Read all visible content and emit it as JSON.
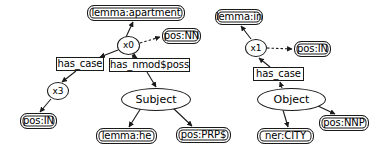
{
  "diagram": {
    "background_color": "#ffffff",
    "stroke_color": "#1a1a1a",
    "text_color": "#000000",
    "node_shapes": {
      "rounded_rect": "attribute",
      "rect": "relation",
      "circle": "variable",
      "ellipse": "concept"
    },
    "edge_styles": {
      "solid": "solid arrow",
      "dashed": "dashed arrow"
    }
  },
  "graphs": [
    {
      "id": "left-graph",
      "name": "apartment-subject-graph",
      "nodes": [
        {
          "id": "l-lemma-apartment",
          "label": "lemma:apartment",
          "shape": "rounded_rect",
          "x": 87,
          "y": 5,
          "w": 98,
          "h": 16
        },
        {
          "id": "l-x0",
          "label": "x0",
          "shape": "circle",
          "x": 117,
          "y": 36,
          "w": 23,
          "h": 19
        },
        {
          "id": "l-pos-nn",
          "label": "pos:NN",
          "shape": "rounded_rect",
          "x": 162,
          "y": 28,
          "w": 39,
          "h": 16
        },
        {
          "id": "l-has-case",
          "label": "has_case",
          "shape": "rect",
          "x": 56,
          "y": 57,
          "w": 48,
          "h": 14
        },
        {
          "id": "l-has-nmod-poss",
          "label": "has_nmod$poss",
          "shape": "rect",
          "x": 109,
          "y": 58,
          "w": 81,
          "h": 14
        },
        {
          "id": "l-x3",
          "label": "x3",
          "shape": "circle",
          "x": 47,
          "y": 82,
          "w": 22,
          "h": 18
        },
        {
          "id": "l-pos-in",
          "label": "pos:IN",
          "shape": "rounded_rect",
          "x": 20,
          "y": 113,
          "w": 37,
          "h": 16
        },
        {
          "id": "l-subject",
          "label": "Subject",
          "shape": "ellipse",
          "x": 121,
          "y": 88,
          "w": 70,
          "h": 23
        },
        {
          "id": "l-lemma-he",
          "label": "lemma:he",
          "shape": "rounded_rect",
          "x": 96,
          "y": 128,
          "w": 61,
          "h": 16
        },
        {
          "id": "l-pos-prps",
          "label": "pos:PRP$",
          "shape": "rounded_rect",
          "x": 176,
          "y": 127,
          "w": 55,
          "h": 16
        }
      ],
      "edges": [
        {
          "from": "l-x0",
          "to": "l-lemma-apartment",
          "style": "solid"
        },
        {
          "from": "l-x0",
          "to": "l-pos-nn",
          "style": "dashed"
        },
        {
          "from": "l-x0",
          "to": "l-has-case",
          "style": "solid"
        },
        {
          "from": "l-x0",
          "to": "l-has-nmod-poss",
          "style": "solid"
        },
        {
          "from": "l-has-case",
          "to": "l-x3",
          "style": "solid"
        },
        {
          "from": "l-x3",
          "to": "l-pos-in",
          "style": "solid"
        },
        {
          "from": "l-has-nmod-poss",
          "to": "l-subject",
          "style": "solid"
        },
        {
          "from": "l-subject",
          "to": "l-lemma-he",
          "style": "solid"
        },
        {
          "from": "l-subject",
          "to": "l-pos-prps",
          "style": "solid"
        }
      ]
    },
    {
      "id": "right-graph",
      "name": "in-object-graph",
      "nodes": [
        {
          "id": "r-lemma-in",
          "label": "lemma:in",
          "shape": "rounded_rect",
          "x": 215,
          "y": 9,
          "w": 48,
          "h": 16
        },
        {
          "id": "r-x1",
          "label": "x1",
          "shape": "circle",
          "x": 245,
          "y": 39,
          "w": 22,
          "h": 18
        },
        {
          "id": "r-pos-in",
          "label": "pos:IN",
          "shape": "rounded_rect",
          "x": 294,
          "y": 41,
          "w": 37,
          "h": 16
        },
        {
          "id": "r-has-case",
          "label": "has_case",
          "shape": "rect",
          "x": 253,
          "y": 67,
          "w": 51,
          "h": 14
        },
        {
          "id": "r-object",
          "label": "Object",
          "shape": "ellipse",
          "x": 257,
          "y": 88,
          "w": 69,
          "h": 23
        },
        {
          "id": "r-ner-city",
          "label": "ner:CITY",
          "shape": "rounded_rect",
          "x": 257,
          "y": 128,
          "w": 57,
          "h": 16
        },
        {
          "id": "r-pos-nnp",
          "label": "pos:NNP",
          "shape": "rounded_rect",
          "x": 319,
          "y": 115,
          "w": 50,
          "h": 16
        }
      ],
      "edges": [
        {
          "from": "r-x1",
          "to": "r-lemma-in",
          "style": "solid"
        },
        {
          "from": "r-x1",
          "to": "r-pos-in",
          "style": "dashed"
        },
        {
          "from": "r-has-case",
          "to": "r-x1",
          "style": "solid"
        },
        {
          "from": "r-object",
          "to": "r-has-case",
          "style": "solid"
        },
        {
          "from": "r-object",
          "to": "r-ner-city",
          "style": "solid"
        },
        {
          "from": "r-object",
          "to": "r-pos-nnp",
          "style": "solid"
        }
      ]
    }
  ],
  "edge_paths": [
    {
      "name": "x0-to-lemma-apartment",
      "d": "M 126 37 L 133 22",
      "style": "solid"
    },
    {
      "name": "x0-to-pos-nn",
      "d": "M 140 43 L 160 37",
      "style": "dashed"
    },
    {
      "name": "x0-to-has-case",
      "d": "M 118 50 L 100 57",
      "style": "solid"
    },
    {
      "name": "x0-to-has-nmod-poss",
      "d": "M 132 55 L 137 58",
      "style": "solid"
    },
    {
      "name": "has-case-to-x3",
      "d": "M 76 71 L 62 82",
      "style": "solid"
    },
    {
      "name": "x3-to-pos-in",
      "d": "M 51 99 L 40 112",
      "style": "solid"
    },
    {
      "name": "has-nmod-poss-to-subject",
      "d": "M 147 72 L 156 87",
      "style": "solid"
    },
    {
      "name": "subject-to-lemma-he",
      "d": "M 141 108 L 129 127",
      "style": "solid"
    },
    {
      "name": "subject-to-pos-prps",
      "d": "M 173 108 L 192 126",
      "style": "solid"
    },
    {
      "name": "x1-to-lemma-in",
      "d": "M 251 39 L 241 26",
      "style": "solid"
    },
    {
      "name": "x1-to-pos-in-right",
      "d": "M 267 48 L 292 49",
      "style": "dashed"
    },
    {
      "name": "has-case-to-x1",
      "d": "M 270 67 L 259 58",
      "style": "solid"
    },
    {
      "name": "object-to-has-case",
      "d": "M 282 88 L 280 82",
      "style": "solid"
    },
    {
      "name": "object-to-ner-city",
      "d": "M 283 110 L 288 127",
      "style": "solid"
    },
    {
      "name": "object-to-pos-nnp",
      "d": "M 318 106 L 335 114",
      "style": "solid"
    }
  ]
}
